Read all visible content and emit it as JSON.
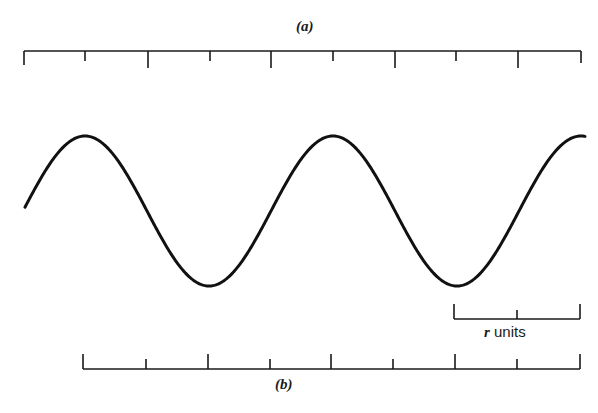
{
  "figure": {
    "panel_a_label": "(a)",
    "panel_b_label": "(b)",
    "scale_bar": {
      "variable": "r",
      "unit_text": "units"
    },
    "colors": {
      "ink": "#1a1a1a",
      "background": "#ffffff"
    }
  },
  "rulers": {
    "top": {
      "y": 51,
      "tick_direction": "down",
      "ticks": [
        {
          "x": 24,
          "len": 14
        },
        {
          "x": 85,
          "len": 10
        },
        {
          "x": 148,
          "len": 17
        },
        {
          "x": 210,
          "len": 10
        },
        {
          "x": 271,
          "len": 17
        },
        {
          "x": 333,
          "len": 10
        },
        {
          "x": 395,
          "len": 17
        },
        {
          "x": 456,
          "len": 10
        },
        {
          "x": 518,
          "len": 17
        },
        {
          "x": 581,
          "len": 12
        }
      ]
    },
    "bottom": {
      "y": 369,
      "tick_direction": "up",
      "ticks": [
        {
          "x": 83,
          "len": 15
        },
        {
          "x": 146,
          "len": 10
        },
        {
          "x": 208,
          "len": 15
        },
        {
          "x": 270,
          "len": 10
        },
        {
          "x": 331,
          "len": 15
        },
        {
          "x": 393,
          "len": 10
        },
        {
          "x": 455,
          "len": 15
        },
        {
          "x": 517,
          "len": 10
        },
        {
          "x": 580,
          "len": 15
        }
      ]
    },
    "scale_bar": {
      "y": 319,
      "x_start": 454,
      "x_end": 580,
      "ticks": [
        {
          "x": 454,
          "len": 15
        },
        {
          "x": 517,
          "len": 9
        },
        {
          "x": 580,
          "len": 15
        }
      ]
    }
  },
  "wave": {
    "type": "sinusoid",
    "amplitude_px": 75,
    "center_y": 211,
    "period_px": 248,
    "peaks_x": [
      85,
      333
    ],
    "troughs_x": [
      209,
      456
    ],
    "x_start": 25,
    "x_end": 585
  }
}
